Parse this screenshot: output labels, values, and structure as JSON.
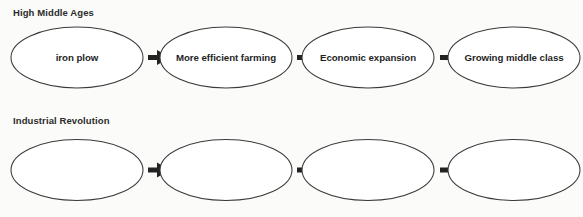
{
  "document": {
    "title": "Cause and Effect Flowchart Worksheet",
    "background_color": "#fbfbfa",
    "text_color": "#1f1f1f",
    "shape_stroke_color": "#3a3a3a",
    "shape_fill_color": "#ffffff",
    "arrow_color": "#222222"
  },
  "sections": [
    {
      "heading": "High Middle Ages",
      "nodes": [
        {
          "label": "iron plow"
        },
        {
          "label": "More efficient farming"
        },
        {
          "label": "Economic expansion"
        },
        {
          "label": "Growing middle class"
        }
      ],
      "connector_count": 3,
      "connector_symbol": "arrow-right"
    },
    {
      "heading": "Industrial Revolution",
      "nodes": [
        {
          "label": ""
        },
        {
          "label": ""
        },
        {
          "label": ""
        },
        {
          "label": ""
        }
      ],
      "connector_count": 3,
      "connector_symbol": "arrow-right"
    }
  ],
  "geometry": {
    "ellipse_rx": 66,
    "ellipse_ry": 30.5,
    "row1_cy": 57.5,
    "row2_cy": 170,
    "centers_x": [
      77,
      226,
      368,
      514
    ],
    "heading1_x": 13,
    "heading1_y": 16,
    "heading2_x": 13,
    "heading2_y": 124,
    "arrow_row1_y": 57.5,
    "arrow_row2_y": 170,
    "arrow_x": [
      148,
      297,
      440
    ],
    "arrow_tail_length": 9,
    "arrow_head_length": 13,
    "arrow_head_half_height": 7.5,
    "arrow_tail_half_height": 2.4
  }
}
